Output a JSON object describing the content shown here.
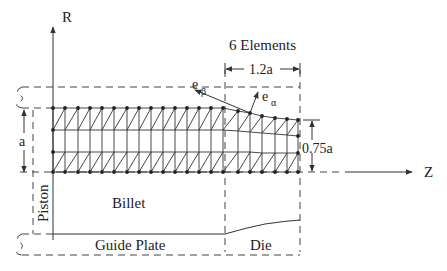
{
  "diagram": {
    "axes": {
      "vertical": "R",
      "horizontal": "Z"
    },
    "labels": {
      "elements": "6 Elements",
      "die_length": "1.2a",
      "radius": "a",
      "exit_radius": "0.75a",
      "e_beta": "e",
      "e_beta_sub": "β",
      "e_alpha": "e",
      "e_alpha_sub": "α",
      "piston": "Piston",
      "billet": "Billet",
      "guide_plate": "Guide Plate",
      "die": "Die"
    },
    "mesh": {
      "columns_x": [
        53,
        65,
        78,
        90,
        102,
        114,
        127,
        139,
        151,
        163,
        175,
        187,
        199,
        211,
        223,
        238,
        250,
        262,
        275,
        287,
        298
      ],
      "row_top_y": [
        108,
        108,
        108,
        108,
        108,
        108,
        108,
        108,
        108,
        108,
        108,
        108,
        108,
        108,
        108,
        111,
        113,
        116,
        118,
        119,
        120
      ],
      "row_2_y": [
        130,
        130,
        130,
        130,
        130,
        130,
        130,
        130,
        130,
        130,
        130,
        130,
        130,
        130,
        130,
        131,
        132,
        133,
        134,
        135,
        136
      ],
      "row_3_y": [
        152,
        152,
        152,
        152,
        152,
        152,
        152,
        152,
        152,
        152,
        152,
        152,
        152,
        152,
        152,
        152,
        152,
        153,
        153,
        153,
        153
      ],
      "row_bottom_y": [
        172,
        172,
        172,
        172,
        172,
        172,
        172,
        172,
        172,
        172,
        172,
        172,
        172,
        172,
        172,
        172,
        172,
        172,
        172,
        172,
        172
      ],
      "die_elements": 6
    },
    "colors": {
      "ink": "#222222",
      "background": "#ffffff"
    }
  }
}
